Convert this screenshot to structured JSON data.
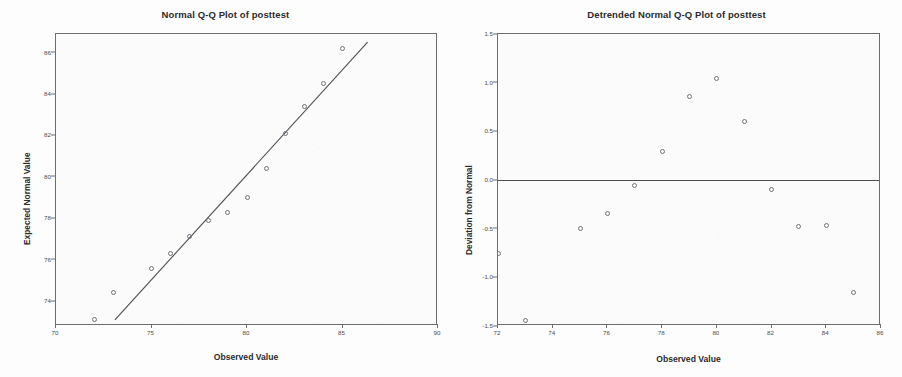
{
  "chart_data": [
    {
      "type": "scatter",
      "title": "Normal Q-Q Plot of posttest",
      "xlabel": "Observed Value",
      "ylabel": "Expected Normal Value",
      "xlim": [
        70,
        90
      ],
      "ylim": [
        72.8,
        86.9
      ],
      "xticks": [
        70,
        75,
        80,
        85,
        90
      ],
      "xticklabels": [
        "70",
        "75",
        "80",
        "85",
        "90"
      ],
      "yticks": [
        74,
        76,
        78,
        80,
        82,
        84,
        86
      ],
      "yticklabels": [
        "74",
        "76",
        "78",
        "80",
        "82",
        "84",
        "86"
      ],
      "grid": false,
      "legend": null,
      "series": [
        {
          "name": "observed vs expected normal",
          "marker": "open-circle",
          "points": [
            {
              "x": 72,
              "y": 73.1
            },
            {
              "x": 73,
              "y": 74.4
            },
            {
              "x": 75,
              "y": 75.6
            },
            {
              "x": 76,
              "y": 76.3
            },
            {
              "x": 77,
              "y": 77.1
            },
            {
              "x": 78,
              "y": 77.9
            },
            {
              "x": 79,
              "y": 78.3
            },
            {
              "x": 80,
              "y": 79.0
            },
            {
              "x": 81,
              "y": 80.4
            },
            {
              "x": 82,
              "y": 82.1
            },
            {
              "x": 83,
              "y": 83.4
            },
            {
              "x": 84,
              "y": 84.5
            },
            {
              "x": 85,
              "y": 86.2
            }
          ]
        }
      ],
      "reference_line": {
        "name": "normal-fit-line",
        "x": [
          73.1,
          86.4
        ],
        "y": [
          73.0,
          86.5
        ]
      }
    },
    {
      "type": "scatter",
      "title": "Detrended Normal Q-Q Plot of posttest",
      "xlabel": "Observed Value",
      "ylabel": "Deviation from Normal",
      "xlim": [
        72,
        86
      ],
      "ylim": [
        -1.5,
        1.5
      ],
      "xticks": [
        72,
        74,
        76,
        78,
        80,
        82,
        84,
        86
      ],
      "xticklabels": [
        "72",
        "74",
        "76",
        "78",
        "80",
        "82",
        "84",
        "86"
      ],
      "yticks": [
        -1.5,
        -1.0,
        -0.5,
        0.0,
        0.5,
        1.0,
        1.5
      ],
      "yticklabels": [
        "-1.5",
        "-1.0",
        "-0.5",
        "0.0",
        "0.5",
        "1.0",
        "1.5"
      ],
      "grid": false,
      "legend": null,
      "series": [
        {
          "name": "deviation from normal",
          "marker": "open-circle",
          "points": [
            {
              "x": 72,
              "y": -0.75
            },
            {
              "x": 73,
              "y": -1.44
            },
            {
              "x": 75,
              "y": -0.5
            },
            {
              "x": 76,
              "y": -0.34
            },
            {
              "x": 77,
              "y": -0.06
            },
            {
              "x": 78,
              "y": 0.29
            },
            {
              "x": 79,
              "y": 0.86
            },
            {
              "x": 80,
              "y": 1.04
            },
            {
              "x": 81,
              "y": 0.6
            },
            {
              "x": 82,
              "y": -0.1
            },
            {
              "x": 83,
              "y": -0.48
            },
            {
              "x": 84,
              "y": -0.47
            },
            {
              "x": 85,
              "y": -1.16
            }
          ]
        }
      ],
      "reference_line": {
        "name": "zero-deviation-line",
        "y": 0.0
      }
    }
  ],
  "colors": {
    "marker_stroke": "#6f6f7a",
    "axis": "#6d6d6d",
    "fit_line": "#4d4d4d",
    "title_text": "#2b2b2b",
    "tick_text": "#4a4a4a",
    "plot_background": "#fbfbfb",
    "page_background": "#fdfdfd"
  }
}
